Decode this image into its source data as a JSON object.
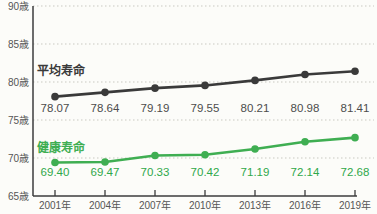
{
  "chart_data": {
    "type": "line",
    "title": "",
    "x_tick_labels": [
      "2001年",
      "2004年",
      "2007年",
      "2010年",
      "2013年",
      "2016年",
      "2019年"
    ],
    "x_values": [
      2001,
      2004,
      2007,
      2010,
      2013,
      2016,
      2019
    ],
    "y_tick_labels": [
      "90歳",
      "85歳",
      "80歳",
      "75歳",
      "70歳",
      "65歳"
    ],
    "y_tick_values": [
      90,
      85,
      80,
      75,
      70,
      65
    ],
    "ylim": [
      65,
      90
    ],
    "grid": "horizontal-dotted",
    "legend_position": "inline-series-labels",
    "series": [
      {
        "name": "平均寿命",
        "values": [
          78.07,
          78.64,
          79.19,
          79.55,
          80.21,
          80.98,
          81.41
        ],
        "value_labels": [
          "78.07",
          "78.64",
          "79.19",
          "79.55",
          "80.21",
          "80.98",
          "81.41"
        ],
        "color": "#3a3a3a",
        "label_color": "#4c4c4c"
      },
      {
        "name": "健康寿命",
        "values": [
          69.4,
          69.47,
          70.33,
          70.42,
          71.19,
          72.14,
          72.68
        ],
        "value_labels": [
          "69.40",
          "69.47",
          "70.33",
          "70.42",
          "71.19",
          "72.14",
          "72.68"
        ],
        "color": "#3fae52",
        "label_color": "#2fa84a"
      }
    ],
    "colors": {
      "grid": "#c9c9c2",
      "axis": "#3c3c3c",
      "tick_text": "#555555",
      "background": "#fcfcf9"
    }
  }
}
